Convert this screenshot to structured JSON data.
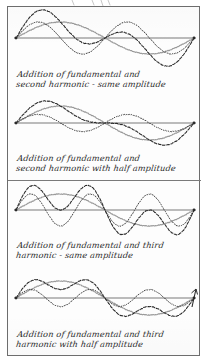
{
  "figure": {
    "kind": "handwritten-scan",
    "top_bleed_text_fragment": "",
    "border_color": "#6d6d6d",
    "paper_color": "#fdfdfd",
    "ink_color": "#2a2a2a"
  },
  "colors": {
    "fundamental": "#9a9a9a",
    "harmonic": "#3a3a3a",
    "resultant": "#2a2a2a",
    "axis": "#7a7a7a",
    "frame": "#6d6d6d"
  },
  "panels": [
    {
      "id": "panel-1",
      "caption": "Addition of fundamental and\nsecond harmonic - same amplitude",
      "fundamental_amplitude": 1.0,
      "harmonic_order": 2,
      "harmonic_amplitude": 1.0,
      "has_arrow_marker": false
    },
    {
      "id": "panel-2",
      "caption": "Addition of fundamental and\nsecond harmonic with half amplitude",
      "fundamental_amplitude": 1.0,
      "harmonic_order": 2,
      "harmonic_amplitude": 0.5,
      "has_arrow_marker": false
    },
    {
      "id": "panel-3",
      "caption": "Addition of fundamental and third\nharmonic - same amplitude",
      "fundamental_amplitude": 1.0,
      "harmonic_order": 3,
      "harmonic_amplitude": 1.0,
      "has_arrow_marker": false
    },
    {
      "id": "panel-4",
      "caption": "Addition of fundamental and third\nharmonic with half amplitude",
      "fundamental_amplitude": 1.0,
      "harmonic_order": 3,
      "harmonic_amplitude": 0.5,
      "has_arrow_marker": true
    }
  ],
  "chart_data": {
    "type": "line",
    "title": "",
    "xlabel": "",
    "ylabel": "",
    "x_range": [
      0,
      6.283185307
    ],
    "grid": false,
    "legend": "none",
    "subplots": [
      {
        "name": "Addition of fundamental and second harmonic - same amplitude",
        "series": [
          {
            "name": "fundamental",
            "style": "solid-gray",
            "formula": "sin(x)",
            "amplitude": 1.0,
            "cycles": 1
          },
          {
            "name": "second harmonic",
            "style": "dotted",
            "formula": "sin(2x)",
            "amplitude": 1.0,
            "cycles": 2
          },
          {
            "name": "resultant",
            "style": "dashed",
            "formula": "sin(x)+sin(2x)",
            "amplitude": 1.76,
            "cycles": 1
          }
        ]
      },
      {
        "name": "Addition of fundamental and second harmonic with half amplitude",
        "series": [
          {
            "name": "fundamental",
            "style": "solid-gray",
            "formula": "sin(x)",
            "amplitude": 1.0,
            "cycles": 1
          },
          {
            "name": "second harmonic",
            "style": "dotted",
            "formula": "0.5*sin(2x)",
            "amplitude": 0.5,
            "cycles": 2
          },
          {
            "name": "resultant",
            "style": "dashed",
            "formula": "sin(x)+0.5*sin(2x)",
            "amplitude": 1.37,
            "cycles": 1
          }
        ]
      },
      {
        "name": "Addition of fundamental and third harmonic - same amplitude",
        "series": [
          {
            "name": "fundamental",
            "style": "solid-gray",
            "formula": "sin(x)",
            "amplitude": 1.0,
            "cycles": 1
          },
          {
            "name": "third harmonic",
            "style": "dotted",
            "formula": "sin(3x)",
            "amplitude": 1.0,
            "cycles": 3
          },
          {
            "name": "resultant",
            "style": "dashed",
            "formula": "sin(x)+sin(3x)",
            "amplitude": 1.5,
            "cycles": 1
          }
        ]
      },
      {
        "name": "Addition of fundamental and third harmonic with half amplitude",
        "series": [
          {
            "name": "fundamental",
            "style": "solid-gray",
            "formula": "sin(x)",
            "amplitude": 1.0,
            "cycles": 1
          },
          {
            "name": "third harmonic",
            "style": "dotted",
            "formula": "0.5*sin(3x)",
            "amplitude": 0.5,
            "cycles": 3
          },
          {
            "name": "resultant",
            "style": "dashed",
            "formula": "sin(x)+0.5*sin(3x)",
            "amplitude": 1.17,
            "cycles": 1
          }
        ]
      }
    ]
  }
}
